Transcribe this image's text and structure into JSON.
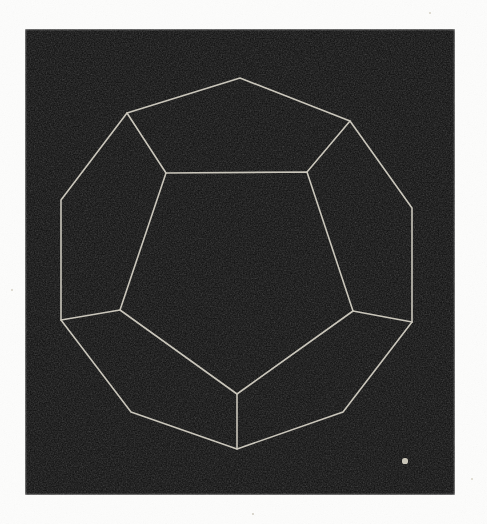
{
  "figure": {
    "caption": "",
    "medium": "halftone print scan",
    "canvas": {
      "width": 487,
      "height": 524
    },
    "page_background": "#fdfdfc",
    "plate": {
      "name": "black printed plate",
      "x": 25,
      "y": 29,
      "width": 430,
      "height": 466,
      "fill": "#0a0a0a",
      "grain_color": "#1c1a18",
      "edge_softness": 2
    },
    "stroke": {
      "color": "#d8d4c8",
      "width": 1.6,
      "linecap": "round",
      "linejoin": "round",
      "opacity": 0.92
    },
    "specks": [
      {
        "name": "bright-speck-lower-right",
        "cx": 405,
        "cy": 461,
        "r": 2.6,
        "color": "#c9c5b8"
      },
      {
        "name": "faint-speck-upper-right",
        "cx": 430,
        "cy": 13,
        "r": 1.1,
        "color": "#d6d2c6"
      },
      {
        "name": "faint-speck-left-margin",
        "cx": 12,
        "cy": 290,
        "r": 1.0,
        "color": "#d6d2c6"
      },
      {
        "name": "faint-speck-bottom-margin",
        "cx": 253,
        "cy": 514,
        "r": 1.2,
        "color": "#cfcbc0"
      },
      {
        "name": "faint-speck-right-margin",
        "cx": 472,
        "cy": 479,
        "r": 1.0,
        "color": "#d9d5c9"
      }
    ]
  },
  "chart_data": {
    "type": "diagram",
    "subtype": "polyhedron-wireframe",
    "solid": "dodecahedron",
    "faces_visible": 6,
    "faces_total": 12,
    "vertices_total": 20,
    "edges_total": 30,
    "projection": "orthographic, viewed down a face normal",
    "xlabel": "",
    "ylabel": "",
    "grid": false,
    "legend": null,
    "annotations": [],
    "outer_decagon": {
      "name": "silhouette-decagon",
      "closed": true,
      "points": [
        [
          240,
          78
        ],
        [
          350,
          121
        ],
        [
          412,
          208
        ],
        [
          412,
          322
        ],
        [
          343,
          412
        ],
        [
          237,
          449
        ],
        [
          131,
          412
        ],
        [
          61,
          320
        ],
        [
          61,
          200
        ],
        [
          127,
          113
        ]
      ]
    },
    "inner_pentagon": {
      "name": "front-face-pentagon",
      "closed": true,
      "points": [
        [
          166,
          173
        ],
        [
          307,
          172
        ],
        [
          353,
          311
        ],
        [
          237,
          394
        ],
        [
          120,
          310
        ]
      ]
    },
    "spokes": {
      "name": "connecting-edges",
      "segments": [
        {
          "from": [
            127,
            113
          ],
          "to": [
            166,
            173
          ]
        },
        {
          "from": [
            350,
            121
          ],
          "to": [
            307,
            172
          ]
        },
        {
          "from": [
            412,
            322
          ],
          "to": [
            353,
            311
          ]
        },
        {
          "from": [
            237,
            449
          ],
          "to": [
            237,
            394
          ]
        },
        {
          "from": [
            61,
            320
          ],
          "to": [
            120,
            310
          ]
        }
      ]
    }
  }
}
